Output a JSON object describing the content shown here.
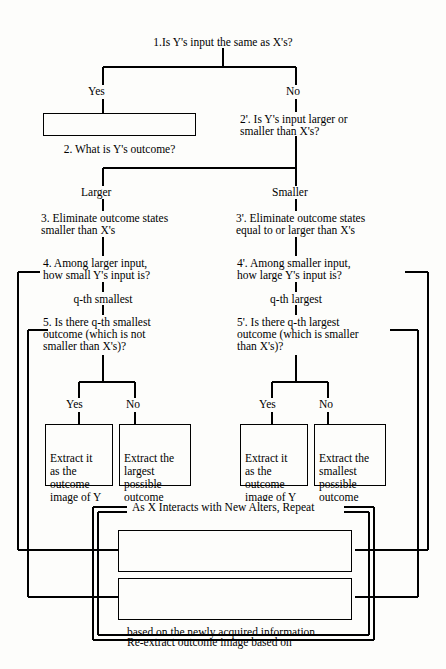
{
  "diagram": {
    "title": "1.Is Y's input the same as X's?",
    "root_question": "1.Is Y's input the same as X's?",
    "branch_labels": {
      "yes": "Yes",
      "no": "No",
      "larger": "Larger",
      "smaller": "Smaller",
      "qth_smallest": "q-th smallest",
      "qth_largest": "q-th largest",
      "yes_left": "Yes",
      "no_left": "No",
      "yes_right": "Yes",
      "no_right": "No"
    },
    "nodes": {
      "step2": "2. What is Y's outcome?",
      "step2p_line1": "2'. Is Y's input larger or",
      "step2p_line2": "smaller than X's?",
      "step3_line1": "3. Eliminate outcome states",
      "step3_line2": "smaller than X's",
      "step3p_line1": "3'. Eliminate outcome states",
      "step3p_line2": "equal to or larger than X's",
      "step4_line1": "4. Among larger input,",
      "step4_line2": "how small Y's input is?",
      "step4p_line1": "4'. Among smaller input,",
      "step4p_line2": "how large Y's input is?",
      "step5_line1": "5. Is there q-th smallest",
      "step5_line2": "outcome (which is not",
      "step5_line3": "smaller than X's)?",
      "step5p_line1": "5'. Is there q-th largest",
      "step5p_line2": "outcome (which is smaller",
      "step5p_line3": "than X's)?"
    },
    "outcome_boxes": {
      "left_yes": "Extract it\nas the\noutcome\nimage of Y",
      "left_no": "Extract the\nlargest\npossible\noutcome",
      "right_yes": "Extract it\nas the\noutcome\nimage of Y",
      "right_no": "Extract the\nsmallest\npossible\noutcome"
    },
    "loop": {
      "title": "As X Interacts with New Alters, Repeat",
      "box1_line1": "Correct the estimated rank of Y's input",
      "box1_line2": "based on the newly acquired information",
      "box2_line1": "Re-extract outcome image based on",
      "box2_line2": "the renewed set of outcomes in the image"
    },
    "colors": {
      "ink": "#000000",
      "paper": "#fdfdfb"
    }
  }
}
